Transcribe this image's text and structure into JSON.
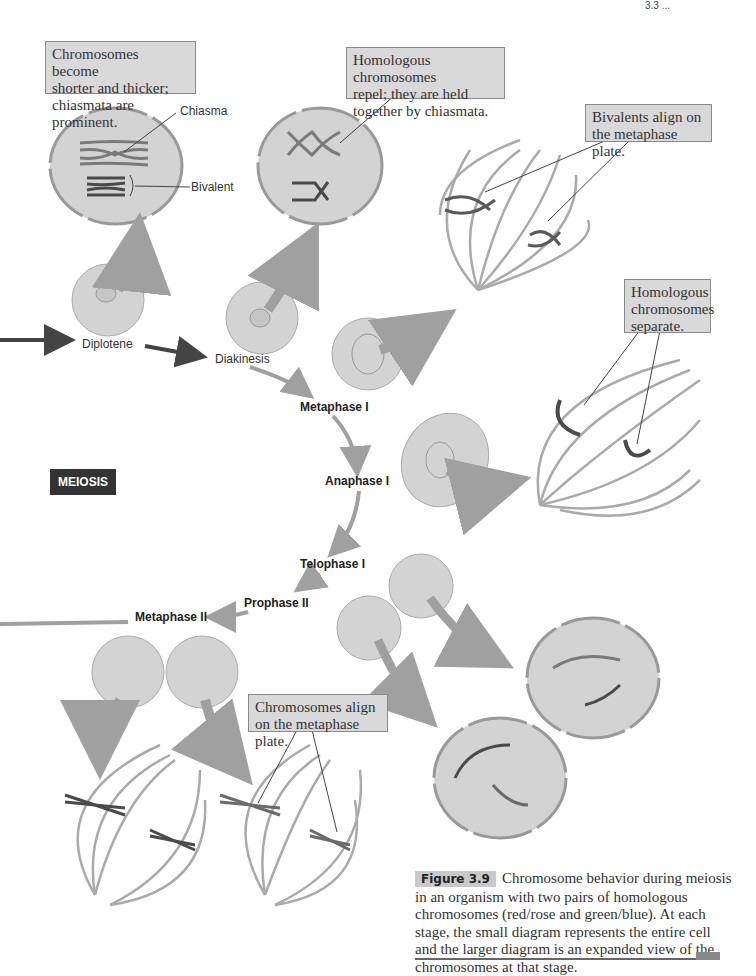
{
  "page_header": "3.3 ...",
  "callouts": {
    "diplotene": "Chromosomes become\nshorter and thicker;\nchiasmata are prominent.",
    "diakinesis": "Homologous chromosomes\nrepel; they are held\ntogether by chiasmata.",
    "metaphase1": "Bivalents align on\nthe metaphase plate.",
    "anaphase1": "Homologous\nchromosomes\nseparate.",
    "metaphase2": "Chromosomes align\non the metaphase plate."
  },
  "labels": {
    "chiasma": "Chiasma",
    "bivalent": "Bivalent"
  },
  "stages": {
    "diplotene": "Diplotene",
    "diakinesis": "Diakinesis",
    "metaphase1": "Metaphase I",
    "anaphase1": "Anaphase I",
    "telophase1": "Telophase I",
    "prophase2": "Prophase II",
    "metaphase2": "Metaphase II"
  },
  "badge": "MEIOSIS",
  "caption": {
    "tag": "Figure 3.9",
    "text": "Chromosome behavior during meiosis in an organism with two pairs of homologous chromosomes (red/rose and green/blue). At each stage, the small diagram represents the entire cell and the larger diagram is an expanded view of the chromosomes at that stage."
  },
  "colors": {
    "cell_fill": "#d3d3d3",
    "cell_edge": "#9a9a9a",
    "spindle": "#a8a8a8",
    "chrom_dark": "#4a4a4a",
    "chrom_light": "#8a8a8a",
    "flow_dark": "#444444",
    "flow_light": "#a0a0a0"
  }
}
